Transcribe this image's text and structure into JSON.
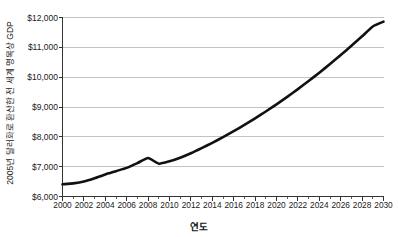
{
  "chart_data": {
    "type": "line",
    "title": "",
    "xlabel": "연도",
    "ylabel": "2005년 달러화로 환산한 전 세계 명목상 GDP",
    "xlim": [
      2000,
      2030
    ],
    "ylim": [
      6000,
      12000
    ],
    "grid": true,
    "grid_axis": "y",
    "legend": "none",
    "y_tick_format": "$#,##0",
    "x_tick_step": 2,
    "x_minor_tick_step": 1,
    "y_tick_step": 1000,
    "line_color": "#111111",
    "line_width": 2.6,
    "grid_color": "#b4b4b4",
    "axis_color": "#333333",
    "background_color": "#ffffff",
    "y_tick_labels": [
      "$12,000",
      "$11,000",
      "$10,000",
      "$9,000",
      "$8,000",
      "$7,000",
      "$6,000"
    ],
    "y_tick_values": [
      12000,
      11000,
      10000,
      9000,
      8000,
      7000,
      6000
    ],
    "x_tick_labels": [
      "2000",
      "2002",
      "2004",
      "2006",
      "2008",
      "2010",
      "2012",
      "2014",
      "2016",
      "2018",
      "2020",
      "2022",
      "2024",
      "2026",
      "2028",
      "2030"
    ],
    "x_tick_values": [
      2000,
      2002,
      2004,
      2006,
      2008,
      2010,
      2012,
      2014,
      2016,
      2018,
      2020,
      2022,
      2024,
      2026,
      2028,
      2030
    ],
    "x": [
      2000,
      2001,
      2002,
      2003,
      2004,
      2005,
      2006,
      2007,
      2008,
      2009,
      2010,
      2011,
      2012,
      2013,
      2014,
      2015,
      2016,
      2017,
      2018,
      2019,
      2020,
      2021,
      2022,
      2023,
      2024,
      2025,
      2026,
      2027,
      2028,
      2029,
      2030
    ],
    "values": [
      6410,
      6440,
      6500,
      6610,
      6740,
      6850,
      6960,
      7120,
      7290,
      7100,
      7180,
      7300,
      7450,
      7620,
      7800,
      7990,
      8190,
      8400,
      8620,
      8850,
      9090,
      9340,
      9600,
      9870,
      10150,
      10440,
      10740,
      11050,
      11370,
      11700,
      11860
    ],
    "series": [
      {
        "name": "전 세계 명목상 GDP",
        "values": [
          6410,
          6440,
          6500,
          6610,
          6740,
          6850,
          6960,
          7120,
          7290,
          7100,
          7180,
          7300,
          7450,
          7620,
          7800,
          7990,
          8190,
          8400,
          8620,
          8850,
          9090,
          9340,
          9600,
          9870,
          10150,
          10440,
          10740,
          11050,
          11370,
          11700,
          11860
        ]
      }
    ],
    "annotations": [
      {
        "label": "2008 정점",
        "x": 2008,
        "y": 7290
      },
      {
        "label": "2009 경기 침체 저점",
        "x": 2009,
        "y": 7100
      }
    ]
  }
}
